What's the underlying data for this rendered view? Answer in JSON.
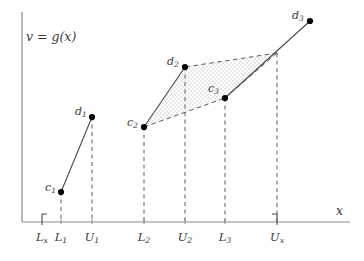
{
  "figure": {
    "title_label": "v = g(x)",
    "x_axis_label": "x",
    "axis_color": "#8a8a8a",
    "line_color": "#4a4a4a",
    "point_color": "#000000",
    "fill_color": "#d9d9d9",
    "background": "#ffffff"
  },
  "axes": {
    "y_axis": {
      "x": 22,
      "y_top": 12,
      "y_bottom": 222
    },
    "x_axis": {
      "y": 222,
      "x_left": 22,
      "x_right": 350
    }
  },
  "ticks": [
    {
      "name": "Lx",
      "label_main": "L",
      "label_sub": "x",
      "x": 42,
      "bracket": "left"
    },
    {
      "name": "L1",
      "label_main": "L",
      "label_sub": "1",
      "x": 61,
      "bracket": "none"
    },
    {
      "name": "U1",
      "label_main": "U",
      "label_sub": "1",
      "x": 92,
      "bracket": "none"
    },
    {
      "name": "L2",
      "label_main": "L",
      "label_sub": "2",
      "x": 144,
      "bracket": "none"
    },
    {
      "name": "U2",
      "label_main": "U",
      "label_sub": "2",
      "x": 185,
      "bracket": "none"
    },
    {
      "name": "L3",
      "label_main": "L",
      "label_sub": "3",
      "x": 225,
      "bracket": "none"
    },
    {
      "name": "Ux",
      "label_main": "U",
      "label_sub": "x",
      "x": 277,
      "bracket": "right"
    }
  ],
  "points": [
    {
      "name": "c1",
      "label_main": "c",
      "label_sub": "1",
      "x": 61,
      "y": 192,
      "label_dx": -16,
      "label_dy": -5
    },
    {
      "name": "d1",
      "label_main": "d",
      "label_sub": "1",
      "x": 92,
      "y": 117,
      "label_dx": -17,
      "label_dy": -6
    },
    {
      "name": "c2",
      "label_main": "c",
      "label_sub": "2",
      "x": 144,
      "y": 127,
      "label_dx": -17,
      "label_dy": -5
    },
    {
      "name": "d2",
      "label_main": "d",
      "label_sub": "2",
      "x": 185,
      "y": 67,
      "label_dx": -18,
      "label_dy": -6
    },
    {
      "name": "c3",
      "label_main": "c",
      "label_sub": "3",
      "x": 225,
      "y": 98,
      "label_dx": -17,
      "label_dy": -10
    },
    {
      "name": "d3",
      "label_main": "d",
      "label_sub": "3",
      "x": 310,
      "y": 21,
      "label_dx": -18,
      "label_dy": -6
    }
  ],
  "corner_point": {
    "name": "upper-right-corner",
    "x": 277,
    "y": 53
  },
  "solid_segments": [
    {
      "name": "segment-c1-d1",
      "x1": 61,
      "y1": 192,
      "x2": 92,
      "y2": 117
    },
    {
      "name": "segment-c2-d2",
      "x1": 144,
      "y1": 127,
      "x2": 185,
      "y2": 67
    },
    {
      "name": "segment-c3-d3",
      "x1": 225,
      "y1": 98,
      "x2": 310,
      "y2": 21
    }
  ],
  "dashed_hull_segments": [
    {
      "name": "hull-c2-c3",
      "x1": 144,
      "y1": 127,
      "x2": 225,
      "y2": 98
    },
    {
      "name": "hull-c3-corner",
      "x1": 225,
      "y1": 98,
      "x2": 277,
      "y2": 53
    },
    {
      "name": "hull-corner-d2",
      "x1": 277,
      "y1": 53,
      "x2": 185,
      "y2": 67
    }
  ],
  "shaded_region": {
    "name": "shaded-polygon",
    "points": "144,127 185,67 277,53 225,98"
  },
  "dashed_verticals": [
    {
      "name": "drop-c1",
      "x": 61,
      "y_top": 192,
      "y_bottom": 222
    },
    {
      "name": "drop-d1",
      "x": 92,
      "y_top": 117,
      "y_bottom": 222
    },
    {
      "name": "drop-c2",
      "x": 144,
      "y_top": 127,
      "y_bottom": 222
    },
    {
      "name": "drop-d2",
      "x": 185,
      "y_top": 67,
      "y_bottom": 222
    },
    {
      "name": "drop-c3",
      "x": 225,
      "y_top": 98,
      "y_bottom": 222
    },
    {
      "name": "drop-ux",
      "x": 277,
      "y_top": 53,
      "y_bottom": 222
    }
  ]
}
